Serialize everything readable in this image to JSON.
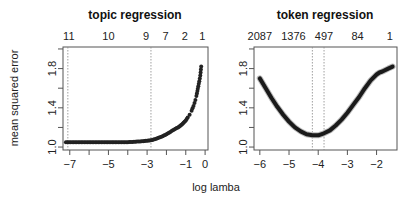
{
  "figure": {
    "shared_xlabel": "log lamba",
    "shared_ylabel": "mean squared error"
  },
  "chart_data": [
    {
      "type": "scatter",
      "title": "topic regression",
      "xlabel": "log lamba",
      "ylabel": "mean squared error",
      "xlim": [
        -7.35,
        0.15
      ],
      "ylim": [
        0.97,
        2.02
      ],
      "x_ticks": [
        -7,
        -6,
        -5,
        -4,
        -3,
        -2,
        -1,
        0
      ],
      "x_tick_labels": [
        "-7",
        "",
        "-5",
        "",
        "-3",
        "",
        "-1",
        "0"
      ],
      "y_ticks": [
        1.0,
        1.2,
        1.4,
        1.6,
        1.8,
        2.0
      ],
      "y_tick_labels": [
        "1.0",
        "",
        "1.4",
        "",
        "1.8",
        ""
      ],
      "top_axis": {
        "positions": [
          -7.05,
          -5.0,
          -3.05,
          -2.05,
          -1.05,
          -0.15
        ],
        "labels": [
          "11",
          "10",
          "9",
          "7",
          "2",
          "1"
        ]
      },
      "vlines": [
        -7.1,
        -2.8
      ],
      "series": [
        {
          "name": "cv mse",
          "marker": "dot",
          "x": [
            -7.2,
            -6.8,
            -6.4,
            -6.0,
            -5.6,
            -5.2,
            -4.8,
            -4.4,
            -4.0,
            -3.6,
            -3.2,
            -3.0,
            -2.8,
            -2.6,
            -2.4,
            -2.2,
            -2.0,
            -1.8,
            -1.6,
            -1.4,
            -1.3,
            -1.2,
            -1.1,
            -1.0,
            -0.9,
            -0.8,
            -0.7,
            -0.6,
            -0.5,
            -0.45,
            -0.4,
            -0.35,
            -0.3,
            -0.25,
            -0.2
          ],
          "y": [
            1.05,
            1.05,
            1.05,
            1.05,
            1.05,
            1.05,
            1.05,
            1.05,
            1.05,
            1.055,
            1.06,
            1.065,
            1.07,
            1.08,
            1.095,
            1.11,
            1.13,
            1.155,
            1.18,
            1.2,
            1.215,
            1.23,
            1.25,
            1.27,
            1.3,
            1.33,
            1.37,
            1.42,
            1.48,
            1.52,
            1.57,
            1.62,
            1.67,
            1.73,
            1.82
          ]
        }
      ],
      "grid": false
    },
    {
      "type": "line",
      "title": "token regression",
      "xlabel": "log lamba",
      "ylabel": "",
      "xlim": [
        -6.2,
        -1.3
      ],
      "ylim": [
        0.97,
        2.02
      ],
      "x_ticks": [
        -6,
        -5,
        -4,
        -3,
        -2
      ],
      "x_tick_labels": [
        "-6",
        "-5",
        "-4",
        "-3",
        "-2"
      ],
      "y_ticks": [
        1.0,
        1.2,
        1.4,
        1.6,
        1.8,
        2.0
      ],
      "y_tick_labels": [
        "1.0",
        "",
        "1.4",
        "",
        "1.8",
        ""
      ],
      "top_axis": {
        "positions": [
          -6.0,
          -4.85,
          -3.8,
          -2.65,
          -1.55
        ],
        "labels": [
          "2087",
          "1376",
          "497",
          "84",
          "1"
        ]
      },
      "vlines": [
        -4.2,
        -3.8
      ],
      "series": [
        {
          "name": "cv mse",
          "marker": "thick-line",
          "x": [
            -6.0,
            -5.8,
            -5.6,
            -5.4,
            -5.2,
            -5.0,
            -4.8,
            -4.6,
            -4.4,
            -4.2,
            -4.0,
            -3.8,
            -3.6,
            -3.4,
            -3.2,
            -3.0,
            -2.8,
            -2.6,
            -2.4,
            -2.2,
            -2.0,
            -1.9,
            -1.8,
            -1.6,
            -1.45
          ],
          "y": [
            1.7,
            1.6,
            1.5,
            1.41,
            1.33,
            1.26,
            1.2,
            1.16,
            1.13,
            1.12,
            1.12,
            1.14,
            1.17,
            1.22,
            1.28,
            1.35,
            1.43,
            1.51,
            1.6,
            1.68,
            1.74,
            1.76,
            1.77,
            1.8,
            1.82
          ]
        }
      ],
      "grid": false
    }
  ]
}
